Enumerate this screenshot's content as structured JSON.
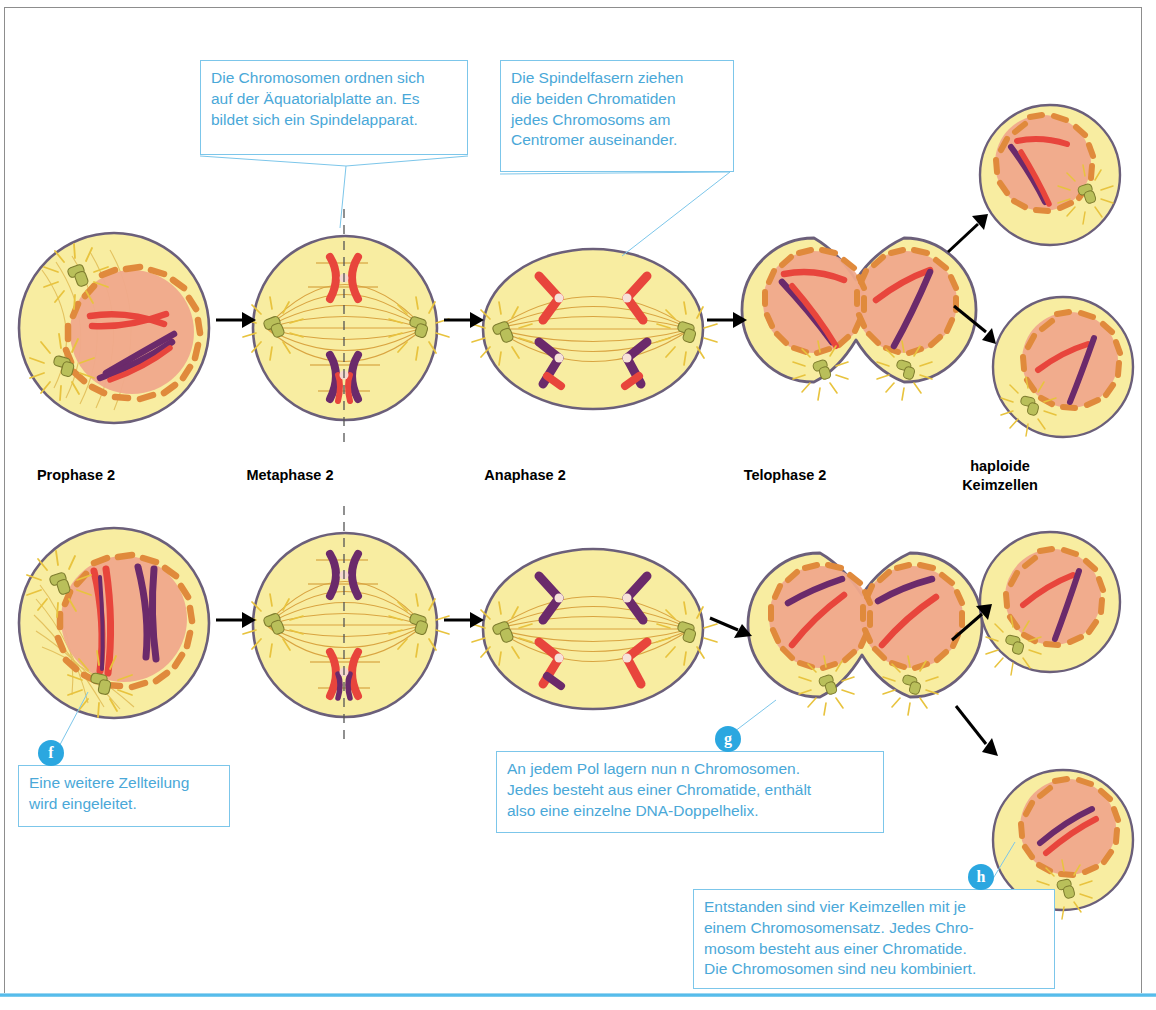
{
  "figure": {
    "accent_blue": "#4aa8d8",
    "badge_blue": "#2ba7e0",
    "cytoplasm_color": "#f8eda1",
    "nucleus_color": "#f0a98c",
    "membrane_color": "#6b5f7a",
    "envelope_color": "#e08a3c",
    "chromosome_red": "#e8453c",
    "chromosome_purple": "#6b2a6b",
    "centriole_color": "#b9bf5a",
    "aster_color": "#e8c33e",
    "spindle_color": "#d9a441",
    "arrow_color": "#000000"
  },
  "phase_labels": [
    {
      "id": "prophase-2",
      "text": "Prophase 2",
      "x": 76,
      "y": 466
    },
    {
      "id": "metaphase-2",
      "text": "Metaphase 2",
      "x": 290,
      "y": 466
    },
    {
      "id": "anaphase-2",
      "text": "Anaphase 2",
      "x": 525,
      "y": 466
    },
    {
      "id": "telophase-2",
      "text": "Telophase 2",
      "x": 785,
      "y": 466
    },
    {
      "id": "haploide-keimzellen",
      "text": "haploide\nKeimzellen",
      "x": 1000,
      "y": 457
    }
  ],
  "callouts": [
    {
      "id": "metaphase-callout",
      "marker": null,
      "lines": [
        "Die Chromosomen ordnen sich",
        "auf der Äquatorialplatte an. Es",
        "bildet sich ein Spindelapparat."
      ],
      "x": 200,
      "y": 60,
      "w": 268,
      "h": 95
    },
    {
      "id": "anaphase-callout",
      "marker": null,
      "lines": [
        "Die Spindelfasern ziehen",
        "die beiden Chromatiden",
        "jedes Chromosoms am",
        "Centromer auseinander."
      ],
      "x": 500,
      "y": 60,
      "w": 234,
      "h": 112
    },
    {
      "id": "callout-f",
      "marker": "f",
      "lines": [
        "Eine weitere Zellteilung",
        "wird eingeleitet."
      ],
      "x": 18,
      "y": 765,
      "w": 212,
      "h": 62
    },
    {
      "id": "callout-g",
      "marker": "g",
      "lines": [
        "An jedem Pol lagern nun n Chromosomen.",
        "Jedes besteht aus einer Chromatide, enthält",
        "also eine einzelne DNA-Doppelhelix."
      ],
      "x": 496,
      "y": 751,
      "w": 388,
      "h": 82
    },
    {
      "id": "callout-h",
      "marker": "h",
      "lines": [
        "Entstanden sind vier Keimzellen mit je",
        "einem Chromosomensatz. Jedes Chro-",
        "mosom besteht aus einer Chromatide.",
        "Die Chromosomen sind neu kombiniert."
      ],
      "x": 693,
      "y": 889,
      "w": 362,
      "h": 100
    }
  ],
  "rows": [
    {
      "id": "row-top",
      "cells": [
        {
          "id": "prophase-2-top",
          "stage": "prophase",
          "label": "Prophase 2"
        },
        {
          "id": "metaphase-2-top",
          "stage": "metaphase",
          "label": "Metaphase 2"
        },
        {
          "id": "anaphase-2-top",
          "stage": "anaphase",
          "label": "Anaphase 2"
        },
        {
          "id": "telophase-2-top",
          "stage": "telophase",
          "label": "Telophase 2"
        },
        {
          "id": "keimzelle-1",
          "stage": "gamete",
          "label": "haploide Keimzelle"
        },
        {
          "id": "keimzelle-2",
          "stage": "gamete",
          "label": "haploide Keimzelle"
        }
      ]
    },
    {
      "id": "row-bottom",
      "cells": [
        {
          "id": "prophase-2-bottom",
          "stage": "prophase",
          "label": "Prophase 2"
        },
        {
          "id": "metaphase-2-bottom",
          "stage": "metaphase",
          "label": "Metaphase 2"
        },
        {
          "id": "anaphase-2-bottom",
          "stage": "anaphase",
          "label": "Anaphase 2"
        },
        {
          "id": "telophase-2-bottom",
          "stage": "telophase",
          "label": "Telophase 2"
        },
        {
          "id": "keimzelle-3",
          "stage": "gamete",
          "label": "haploide Keimzelle"
        },
        {
          "id": "keimzelle-4",
          "stage": "gamete",
          "label": "haploide Keimzelle"
        }
      ]
    }
  ]
}
